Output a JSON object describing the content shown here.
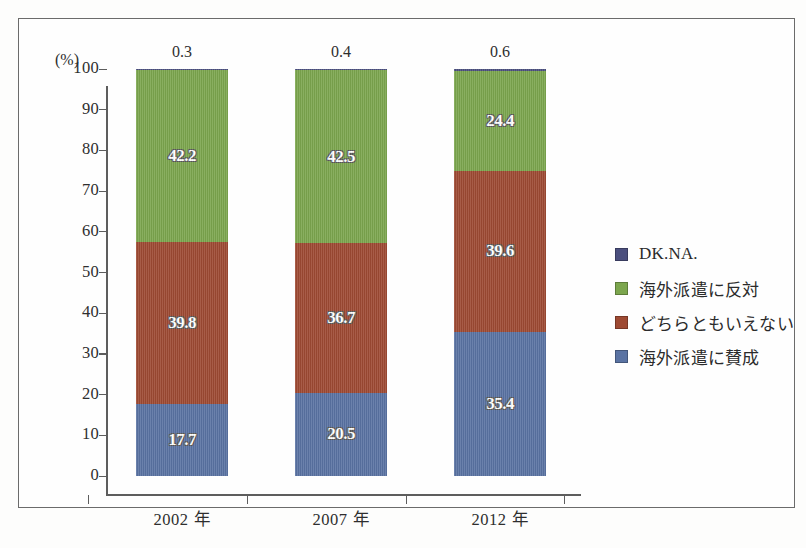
{
  "axis": {
    "unit_label": "(%)",
    "y_ticks": [
      "100",
      "90",
      "80",
      "70",
      "60",
      "50",
      "40",
      "30",
      "20",
      "10",
      "0"
    ],
    "x_categories": [
      "2002 年",
      "2007 年",
      "2012 年"
    ]
  },
  "legend": {
    "items": [
      {
        "label": "DK.NA.",
        "color": "#4b4f7e"
      },
      {
        "label": "海外派遣に反対",
        "color": "#7ca64e"
      },
      {
        "label": "どちらともいえない",
        "color": "#9e4a33"
      },
      {
        "label": "海外派遣に賛成",
        "color": "#5a73a3"
      }
    ]
  },
  "chart_data": {
    "type": "bar",
    "stacked": true,
    "title": "",
    "xlabel": "",
    "ylabel": "(%)",
    "ylim": [
      0,
      100
    ],
    "ytick_step": 10,
    "grid": false,
    "legend_position": "right",
    "categories": [
      "2002 年",
      "2007 年",
      "2012 年"
    ],
    "series": [
      {
        "name": "海外派遣に賛成",
        "color": "#5a73a3",
        "values": [
          17.7,
          20.5,
          35.4
        ]
      },
      {
        "name": "どちらともいえない",
        "color": "#9e4a33",
        "values": [
          39.8,
          36.7,
          39.6
        ]
      },
      {
        "name": "海外派遣に反対",
        "color": "#7ca64e",
        "values": [
          42.2,
          42.5,
          24.4
        ]
      },
      {
        "name": "DK.NA.",
        "color": "#4b4f7e",
        "values": [
          0.3,
          0.4,
          0.6
        ]
      }
    ],
    "top_labels": [
      "0.3",
      "0.4",
      "0.6"
    ]
  },
  "bars": [
    {
      "category": "2002 年",
      "top_label": "0.3",
      "segments": [
        {
          "name": "DK.NA.",
          "value": 0.3,
          "label": "",
          "color": "#4b4f7e"
        },
        {
          "name": "海外派遣に反対",
          "value": 42.2,
          "label": "42.2",
          "color": "#7ca64e"
        },
        {
          "name": "どちらともいえない",
          "value": 39.8,
          "label": "39.8",
          "color": "#9e4a33"
        },
        {
          "name": "海外派遣に賛成",
          "value": 17.7,
          "label": "17.7",
          "color": "#5a73a3"
        }
      ]
    },
    {
      "category": "2007 年",
      "top_label": "0.4",
      "segments": [
        {
          "name": "DK.NA.",
          "value": 0.4,
          "label": "",
          "color": "#4b4f7e"
        },
        {
          "name": "海外派遣に反対",
          "value": 42.5,
          "label": "42.5",
          "color": "#7ca64e"
        },
        {
          "name": "どちらともいえない",
          "value": 36.7,
          "label": "36.7",
          "color": "#9e4a33"
        },
        {
          "name": "海外派遣に賛成",
          "value": 20.5,
          "label": "20.5",
          "color": "#5a73a3"
        }
      ]
    },
    {
      "category": "2012 年",
      "top_label": "0.6",
      "segments": [
        {
          "name": "DK.NA.",
          "value": 0.6,
          "label": "",
          "color": "#4b4f7e"
        },
        {
          "name": "海外派遣に反対",
          "value": 24.4,
          "label": "24.4",
          "color": "#7ca64e"
        },
        {
          "name": "どちらともいえない",
          "value": 39.6,
          "label": "39.6",
          "color": "#9e4a33"
        },
        {
          "name": "海外派遣に賛成",
          "value": 35.4,
          "label": "35.4",
          "color": "#5a73a3"
        }
      ]
    }
  ]
}
